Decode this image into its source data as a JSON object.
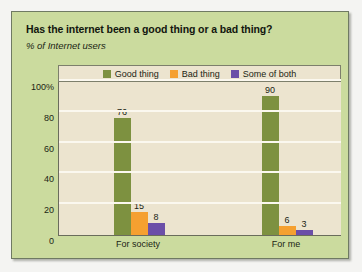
{
  "chart_data": {
    "type": "bar",
    "title": "Has the internet been a good thing or a bad thing?",
    "subtitle": "% of Internet users",
    "xlabel": "",
    "ylabel": "",
    "ylim": [
      0,
      100
    ],
    "yticks": [
      "0",
      "20",
      "40",
      "60",
      "80",
      "100%"
    ],
    "ytick_values": [
      0,
      20,
      40,
      60,
      80,
      100
    ],
    "grid": "horizontal",
    "legend_position": "top-center",
    "categories": [
      "For society",
      "For me"
    ],
    "series": [
      {
        "name": "Good thing",
        "color": "#7d9140",
        "values": [
          76,
          90
        ]
      },
      {
        "name": "Bad thing",
        "color": "#f5a030",
        "values": [
          15,
          6
        ]
      },
      {
        "name": "Some of both",
        "color": "#6b4fa8",
        "values": [
          8,
          3
        ]
      }
    ]
  },
  "colors": {
    "panel_background": "#cbdb9e",
    "plot_background": "#ece4cf",
    "gridline": "#fbf8ef",
    "axis": "#6a6c5c",
    "text": "#1b1f14"
  }
}
